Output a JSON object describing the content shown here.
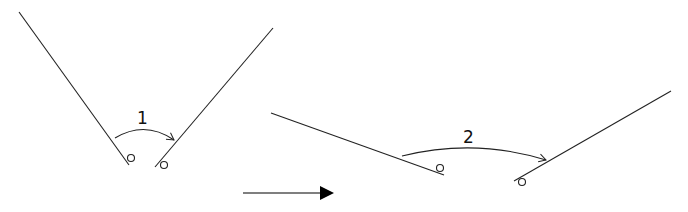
{
  "diagram": {
    "stage1": {
      "label": "1"
    },
    "stage2": {
      "label": "2"
    },
    "colors": {
      "stroke": "#222222",
      "arrow": "#000000"
    }
  }
}
